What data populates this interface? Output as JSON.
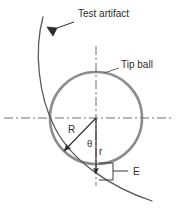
{
  "diagram": {
    "title_visible": false,
    "labels": {
      "test_artifact": "Test artifact",
      "tip_ball": "Tip ball",
      "radius_big": "R",
      "angle": "θ",
      "radius_small": "r",
      "offset": "E"
    },
    "colors": {
      "ball_stroke": "#8c8c8c",
      "artifact_stroke": "#5a5a5a",
      "centerline": "#6e6e6e",
      "dimension_line": "#3a3a3a",
      "text": "#2b2b2b",
      "background": "#ffffff"
    },
    "geometry": {
      "ball_center_x": 96,
      "ball_center_y": 118,
      "ball_radius": 46,
      "vertical_centerline_top": 46,
      "vertical_centerline_bottom": 186,
      "horizontal_centerline_left": 4,
      "horizontal_centerline_right": 173,
      "r_arrow_tip_y": 178,
      "R_arrow_tip_x": 62,
      "R_arrow_tip_y": 153
    }
  }
}
